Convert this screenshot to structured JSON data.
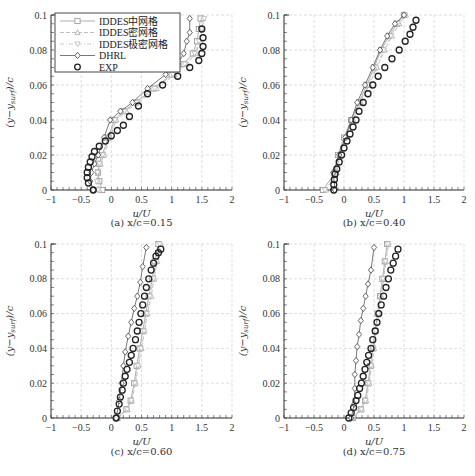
{
  "chart_data": [
    {
      "type": "line",
      "panel": "a",
      "caption": "(a) x/c=0.15",
      "xlabel": "u/U",
      "ylabel": "(y−y_surf)/c",
      "xlim": [
        -1,
        2
      ],
      "ylim": [
        0,
        0.1
      ],
      "xticks": [
        "−1",
        "−0.5",
        "0",
        "0.5",
        "1",
        "1.5",
        "2"
      ],
      "yticks": [
        "0",
        "0.02",
        "0.04",
        "0.06",
        "0.08",
        "0.1"
      ],
      "grid": true,
      "legend_position": "upper left",
      "series": [
        {
          "name": "IDDES中网格",
          "marker": "square",
          "line": "solid",
          "color": "#9a9a9a",
          "x": [
            -0.15,
            -0.2,
            -0.22,
            -0.2,
            -0.15,
            -0.05,
            0.05,
            0.2,
            0.4,
            0.7,
            1.0,
            1.2,
            1.35,
            1.42,
            1.45,
            1.48
          ],
          "y": [
            0.0,
            0.005,
            0.01,
            0.015,
            0.02,
            0.03,
            0.04,
            0.045,
            0.05,
            0.058,
            0.066,
            0.072,
            0.078,
            0.085,
            0.092,
            0.098
          ]
        },
        {
          "name": "IDDES密网格",
          "marker": "triangle-up",
          "line": "dashed",
          "color": "#b0b0b0",
          "x": [
            -0.2,
            -0.22,
            -0.22,
            -0.18,
            -0.12,
            -0.02,
            0.08,
            0.25,
            0.45,
            0.75,
            1.05,
            1.25,
            1.4,
            1.47,
            1.5,
            1.52
          ],
          "y": [
            0.0,
            0.005,
            0.01,
            0.015,
            0.02,
            0.03,
            0.04,
            0.045,
            0.05,
            0.058,
            0.066,
            0.072,
            0.078,
            0.085,
            0.092,
            0.098
          ]
        },
        {
          "name": "IDDES极密网格",
          "marker": "triangle-down",
          "line": "dash-dot",
          "color": "#c0c0c0",
          "x": [
            -0.22,
            -0.24,
            -0.23,
            -0.2,
            -0.14,
            -0.04,
            0.06,
            0.22,
            0.42,
            0.72,
            1.02,
            1.22,
            1.38,
            1.45,
            1.5,
            1.54
          ],
          "y": [
            0.0,
            0.005,
            0.01,
            0.015,
            0.02,
            0.03,
            0.04,
            0.045,
            0.05,
            0.058,
            0.066,
            0.072,
            0.078,
            0.085,
            0.092,
            0.098
          ]
        },
        {
          "name": "DHRL",
          "marker": "diamond",
          "line": "solid",
          "color": "#555555",
          "x": [
            -0.3,
            -0.35,
            -0.33,
            -0.28,
            -0.22,
            -0.12,
            -0.02,
            0.15,
            0.35,
            0.6,
            0.9,
            1.1,
            1.2,
            1.25,
            1.3,
            1.3
          ],
          "y": [
            0.0,
            0.005,
            0.01,
            0.015,
            0.02,
            0.03,
            0.04,
            0.045,
            0.05,
            0.058,
            0.066,
            0.072,
            0.078,
            0.085,
            0.09,
            0.098
          ]
        },
        {
          "name": "EXP",
          "marker": "circle",
          "line": "none",
          "color": "#222222",
          "x": [
            -0.3,
            -0.38,
            -0.4,
            -0.4,
            -0.38,
            -0.35,
            -0.32,
            -0.28,
            -0.2,
            -0.1,
            0.0,
            0.1,
            0.2,
            0.3,
            0.45,
            0.6,
            0.85,
            1.1,
            1.3,
            1.45,
            1.5,
            1.52,
            1.52,
            1.5
          ],
          "y": [
            0.0,
            0.004,
            0.007,
            0.01,
            0.013,
            0.016,
            0.019,
            0.022,
            0.025,
            0.028,
            0.031,
            0.034,
            0.037,
            0.042,
            0.048,
            0.055,
            0.06,
            0.065,
            0.07,
            0.074,
            0.078,
            0.082,
            0.087,
            0.092
          ]
        }
      ]
    },
    {
      "type": "line",
      "panel": "b",
      "caption": "(b) x/c=0.40",
      "xlabel": "u/U",
      "ylabel": "(y−y_surf)/c",
      "xlim": [
        -1,
        2
      ],
      "ylim": [
        0,
        0.1
      ],
      "xticks": [
        "−1",
        "−0.5",
        "0",
        "0.5",
        "1",
        "1.5",
        "2"
      ],
      "yticks": [
        "0",
        "0.02",
        "0.04",
        "0.06",
        "0.08",
        "0.1"
      ],
      "grid": true,
      "series": [
        {
          "name": "IDDES中网格",
          "marker": "square",
          "line": "solid",
          "color": "#9a9a9a",
          "x": [
            -0.35,
            -0.15,
            -0.1,
            0.0,
            0.12,
            0.25,
            0.38,
            0.5,
            0.62,
            0.75,
            0.88,
            1.0
          ],
          "y": [
            0.0,
            0.01,
            0.02,
            0.03,
            0.04,
            0.05,
            0.06,
            0.07,
            0.08,
            0.088,
            0.095,
            0.1
          ]
        },
        {
          "name": "IDDES密网格",
          "marker": "triangle-up",
          "line": "dashed",
          "color": "#b0b0b0",
          "x": [
            -0.3,
            -0.12,
            -0.07,
            0.03,
            0.15,
            0.28,
            0.42,
            0.55,
            0.68,
            0.8,
            0.92,
            1.03
          ],
          "y": [
            0.0,
            0.01,
            0.02,
            0.03,
            0.04,
            0.05,
            0.06,
            0.07,
            0.08,
            0.088,
            0.095,
            0.1
          ]
        },
        {
          "name": "IDDES极密网格",
          "marker": "triangle-down",
          "line": "dash-dot",
          "color": "#c0c0c0",
          "x": [
            -0.32,
            -0.13,
            -0.08,
            0.02,
            0.14,
            0.27,
            0.4,
            0.53,
            0.66,
            0.78,
            0.9,
            1.02
          ],
          "y": [
            0.0,
            0.01,
            0.02,
            0.03,
            0.04,
            0.05,
            0.06,
            0.07,
            0.08,
            0.088,
            0.095,
            0.1
          ]
        },
        {
          "name": "DHRL",
          "marker": "diamond",
          "line": "solid",
          "color": "#555555",
          "x": [
            -0.15,
            -0.18,
            -0.08,
            0.02,
            0.12,
            0.22,
            0.35,
            0.48,
            0.6,
            0.72,
            0.85,
            1.0
          ],
          "y": [
            0.0,
            0.01,
            0.02,
            0.03,
            0.04,
            0.05,
            0.06,
            0.07,
            0.08,
            0.088,
            0.095,
            0.1
          ]
        },
        {
          "name": "EXP",
          "marker": "circle",
          "line": "none",
          "color": "#222222",
          "x": [
            -0.17,
            -0.17,
            -0.16,
            -0.15,
            -0.12,
            -0.08,
            -0.04,
            0.0,
            0.05,
            0.1,
            0.15,
            0.2,
            0.25,
            0.32,
            0.4,
            0.48,
            0.57,
            0.68,
            0.8,
            0.92,
            1.02,
            1.1,
            1.15,
            1.2
          ],
          "y": [
            0.0,
            0.003,
            0.006,
            0.009,
            0.012,
            0.016,
            0.02,
            0.024,
            0.028,
            0.032,
            0.036,
            0.04,
            0.045,
            0.05,
            0.055,
            0.06,
            0.065,
            0.07,
            0.075,
            0.08,
            0.085,
            0.089,
            0.093,
            0.097
          ]
        }
      ]
    },
    {
      "type": "line",
      "panel": "c",
      "caption": "(c) x/c=0.60",
      "xlabel": "u/U",
      "ylabel": "(y−y_surf)/c",
      "xlim": [
        -1,
        2
      ],
      "ylim": [
        0,
        0.1
      ],
      "xticks": [
        "−1",
        "−0.5",
        "0",
        "0.5",
        "1",
        "1.5",
        "2"
      ],
      "yticks": [
        "0",
        "0.02",
        "0.04",
        "0.06",
        "0.08",
        "0.1"
      ],
      "grid": true,
      "series": [
        {
          "name": "IDDES中网格",
          "marker": "square",
          "line": "solid",
          "color": "#9a9a9a",
          "x": [
            0.1,
            0.25,
            0.32,
            0.38,
            0.42,
            0.47,
            0.52,
            0.57,
            0.62,
            0.68,
            0.72,
            0.78
          ],
          "y": [
            0.0,
            0.005,
            0.01,
            0.02,
            0.03,
            0.04,
            0.05,
            0.06,
            0.07,
            0.08,
            0.09,
            0.1
          ]
        },
        {
          "name": "IDDES密网格",
          "marker": "triangle-up",
          "line": "dashed",
          "color": "#b0b0b0",
          "x": [
            0.1,
            0.27,
            0.34,
            0.4,
            0.45,
            0.5,
            0.55,
            0.6,
            0.66,
            0.71,
            0.76,
            0.82
          ],
          "y": [
            0.0,
            0.005,
            0.01,
            0.02,
            0.03,
            0.04,
            0.05,
            0.06,
            0.07,
            0.08,
            0.09,
            0.1
          ]
        },
        {
          "name": "IDDES极密网格",
          "marker": "triangle-down",
          "line": "dash-dot",
          "color": "#c0c0c0",
          "x": [
            0.1,
            0.26,
            0.33,
            0.39,
            0.44,
            0.49,
            0.54,
            0.59,
            0.64,
            0.7,
            0.75,
            0.8
          ],
          "y": [
            0.0,
            0.005,
            0.01,
            0.02,
            0.03,
            0.04,
            0.05,
            0.06,
            0.07,
            0.08,
            0.09,
            0.1
          ]
        },
        {
          "name": "DHRL",
          "marker": "diamond",
          "line": "solid",
          "color": "#555555",
          "x": [
            0.08,
            0.13,
            0.17,
            0.2,
            0.23,
            0.28,
            0.33,
            0.38,
            0.43,
            0.48,
            0.52,
            0.58
          ],
          "y": [
            0.0,
            0.01,
            0.02,
            0.03,
            0.038,
            0.047,
            0.055,
            0.063,
            0.07,
            0.078,
            0.087,
            0.098
          ]
        },
        {
          "name": "EXP",
          "marker": "circle",
          "line": "none",
          "color": "#222222",
          "x": [
            0.08,
            0.1,
            0.13,
            0.15,
            0.18,
            0.2,
            0.23,
            0.26,
            0.3,
            0.33,
            0.36,
            0.4,
            0.43,
            0.46,
            0.49,
            0.52,
            0.55,
            0.58,
            0.62,
            0.66,
            0.7,
            0.74,
            0.78,
            0.82
          ],
          "y": [
            0.0,
            0.004,
            0.008,
            0.012,
            0.016,
            0.02,
            0.024,
            0.028,
            0.032,
            0.036,
            0.04,
            0.045,
            0.05,
            0.055,
            0.06,
            0.065,
            0.07,
            0.075,
            0.08,
            0.085,
            0.089,
            0.093,
            0.095,
            0.097
          ]
        }
      ]
    },
    {
      "type": "line",
      "panel": "d",
      "caption": "(d) x/c=0.75",
      "xlabel": "u/U",
      "ylabel": "(y−y_surf)/c",
      "xlim": [
        -1,
        2
      ],
      "ylim": [
        0,
        0.1
      ],
      "xticks": [
        "−1",
        "−0.5",
        "0",
        "0.5",
        "1",
        "1.5",
        "2"
      ],
      "yticks": [
        "0",
        "0.02",
        "0.04",
        "0.06",
        "0.08",
        "0.1"
      ],
      "grid": true,
      "series": [
        {
          "name": "IDDES中网格",
          "marker": "square",
          "line": "solid",
          "color": "#9a9a9a",
          "x": [
            0.15,
            0.28,
            0.35,
            0.4,
            0.44,
            0.48,
            0.52,
            0.56,
            0.6,
            0.64,
            0.68,
            0.72
          ],
          "y": [
            0.0,
            0.005,
            0.01,
            0.02,
            0.03,
            0.04,
            0.05,
            0.06,
            0.07,
            0.08,
            0.09,
            0.1
          ]
        },
        {
          "name": "IDDES密网格",
          "marker": "triangle-up",
          "line": "dashed",
          "color": "#b0b0b0",
          "x": [
            0.15,
            0.3,
            0.37,
            0.42,
            0.46,
            0.5,
            0.54,
            0.58,
            0.62,
            0.66,
            0.7,
            0.74
          ],
          "y": [
            0.0,
            0.005,
            0.01,
            0.02,
            0.03,
            0.04,
            0.05,
            0.06,
            0.07,
            0.08,
            0.09,
            0.1
          ]
        },
        {
          "name": "IDDES极密网格",
          "marker": "triangle-down",
          "line": "dash-dot",
          "color": "#c0c0c0",
          "x": [
            0.15,
            0.29,
            0.36,
            0.41,
            0.45,
            0.49,
            0.53,
            0.57,
            0.61,
            0.65,
            0.69,
            0.73
          ],
          "y": [
            0.0,
            0.005,
            0.01,
            0.02,
            0.03,
            0.04,
            0.05,
            0.06,
            0.07,
            0.08,
            0.09,
            0.1
          ]
        },
        {
          "name": "DHRL",
          "marker": "diamond",
          "line": "solid",
          "color": "#555555",
          "x": [
            0.12,
            0.17,
            0.18,
            0.18,
            0.2,
            0.22,
            0.25,
            0.28,
            0.32,
            0.36,
            0.4,
            0.45,
            0.5
          ],
          "y": [
            0.0,
            0.008,
            0.017,
            0.025,
            0.033,
            0.041,
            0.048,
            0.056,
            0.063,
            0.07,
            0.077,
            0.085,
            0.098
          ]
        },
        {
          "name": "EXP",
          "marker": "circle",
          "line": "none",
          "color": "#222222",
          "x": [
            0.08,
            0.12,
            0.16,
            0.2,
            0.23,
            0.26,
            0.29,
            0.32,
            0.35,
            0.38,
            0.41,
            0.45,
            0.48,
            0.52,
            0.55,
            0.58,
            0.62,
            0.66,
            0.7,
            0.74,
            0.78,
            0.82,
            0.86,
            0.9
          ],
          "y": [
            0.0,
            0.003,
            0.006,
            0.01,
            0.013,
            0.017,
            0.02,
            0.024,
            0.028,
            0.032,
            0.036,
            0.04,
            0.045,
            0.05,
            0.055,
            0.06,
            0.065,
            0.07,
            0.075,
            0.08,
            0.085,
            0.089,
            0.093,
            0.097
          ]
        }
      ]
    }
  ],
  "legend": {
    "items": [
      {
        "label": "IDDES中网格"
      },
      {
        "label": "IDDES密网格"
      },
      {
        "label": "IDDES极密网格"
      },
      {
        "label": "DHRL"
      },
      {
        "label": "EXP"
      }
    ]
  },
  "panels": [
    {
      "caption": "(a) x/c=0.15",
      "xlabel": "u/U",
      "ylabel": "(y−y",
      "ylabel_sub": "surf",
      "ylabel_end": ")/c"
    },
    {
      "caption": "(b) x/c=0.40",
      "xlabel": "u/U",
      "ylabel": "(y−y",
      "ylabel_sub": "surf",
      "ylabel_end": ")/c"
    },
    {
      "caption": "(c) x/c=0.60",
      "xlabel": "u/U",
      "ylabel": "(y−y",
      "ylabel_sub": "surf",
      "ylabel_end": ")/c"
    },
    {
      "caption": "(d) x/c=0.75",
      "xlabel": "u/U",
      "ylabel": "(y−y",
      "ylabel_sub": "surf",
      "ylabel_end": ")/c"
    }
  ]
}
